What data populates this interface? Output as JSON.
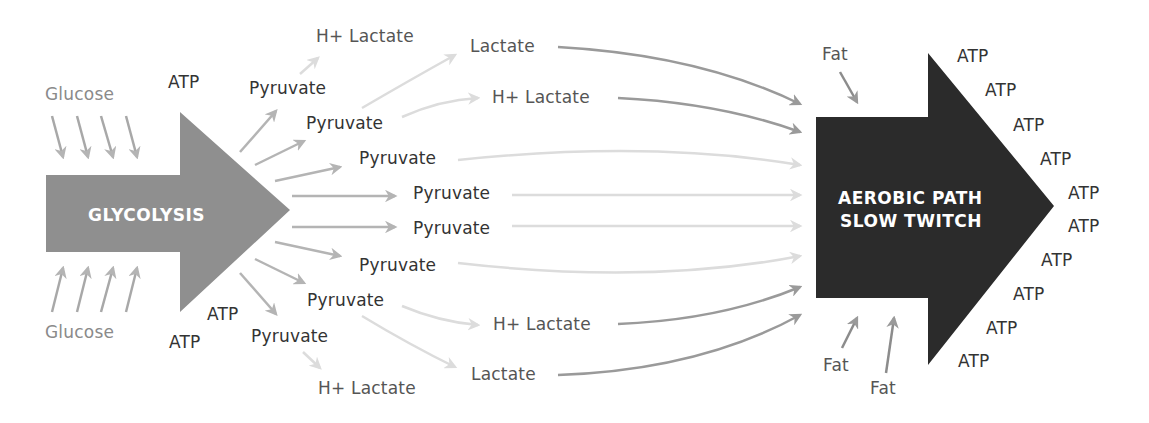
{
  "diagram": {
    "colors": {
      "glycolysis_arrow": "#8f8f8f",
      "aerobic_arrow": "#2b2b2b",
      "dark_flow": "#9a9a9a",
      "light_flow": "#dcdcdc",
      "text": "#333333",
      "grey_text": "#8a8a8a"
    },
    "glycolysis": {
      "label": "GLYCOLYSIS",
      "inputs_top": "Glucose",
      "inputs_bottom": "Glucose",
      "atp_top": "ATP",
      "atp_bottom_1": "ATP",
      "atp_bottom_2": "ATP"
    },
    "aerobic": {
      "label_line1": "AEROBIC PATH",
      "label_line2": "SLOW TWITCH",
      "fat_top": "Fat",
      "fat_bottom_1": "Fat",
      "fat_bottom_2": "Fat",
      "atp_outputs": [
        "ATP",
        "ATP",
        "ATP",
        "ATP",
        "ATP",
        "ATP",
        "ATP",
        "ATP",
        "ATP",
        "ATP"
      ]
    },
    "intermediates": {
      "pyruvate_1": "Pyruvate",
      "pyruvate_2": "Pyruvate",
      "pyruvate_3": "Pyruvate",
      "pyruvate_4": "Pyruvate",
      "pyruvate_5": "Pyruvate",
      "pyruvate_6": "Pyruvate",
      "pyruvate_7": "Pyruvate",
      "pyruvate_8": "Pyruvate",
      "h_lactate_top_left": "H+ Lactate",
      "lactate_top": "Lactate",
      "h_lactate_top_right": "H+ Lactate",
      "h_lactate_bottom_right": "H+ Lactate",
      "lactate_bottom": "Lactate",
      "h_lactate_bottom_left": "H+ Lactate"
    }
  }
}
